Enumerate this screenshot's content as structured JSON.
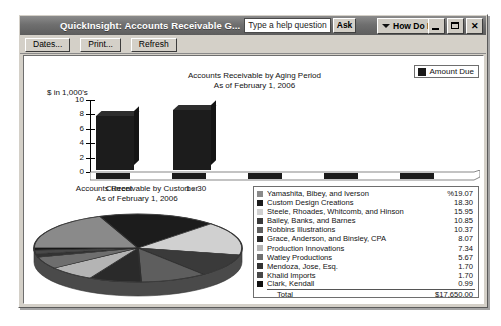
{
  "window": {
    "title": "QuickInsight: Accounts Receivable G...",
    "help_placeholder": "Type a help question",
    "ask_label": "Ask",
    "how_do_i_label": "How Do I?",
    "minimize_label": "Minimize",
    "maximize_label": "Maximize",
    "close_label": "Close"
  },
  "toolbar": {
    "buttons": [
      {
        "label": "Dates..."
      },
      {
        "label": "Print..."
      },
      {
        "label": "Refresh"
      }
    ]
  },
  "bar_chart": {
    "title_line1": "Accounts Receivable by Aging Period",
    "title_line2": "As of February 1, 2006",
    "legend_label": "Amount Due",
    "legend_color": "#1a1a1a",
    "axis_label": "$ in 1,000's"
  },
  "pie_chart": {
    "title_line1": "Accounts Receivable by Customer",
    "title_line2": "As of February 1, 2006"
  },
  "legend": {
    "rows": [
      {
        "name": "Yamashita, Bibey, and Iverson",
        "value": "%19.07",
        "color": "#8a8a8a"
      },
      {
        "name": "Custom Design Creations",
        "value": "18.30",
        "color": "#1c1c1c"
      },
      {
        "name": "Steele, Rhoades, Whitcomb, and Hinson",
        "value": "15.95",
        "color": "#d0d0d0"
      },
      {
        "name": "Bailey, Banks, and Barnes",
        "value": "10.85",
        "color": "#3a3a3a"
      },
      {
        "name": "Robbins Illustrations",
        "value": "10.37",
        "color": "#5e5e5e"
      },
      {
        "name": "Grace, Anderson, and Binsley, CPA",
        "value": "8.07",
        "color": "#2a2a2a"
      },
      {
        "name": "Production Innovations",
        "value": "7.34",
        "color": "#b4b4b4"
      },
      {
        "name": "Watley Productions",
        "value": "5.67",
        "color": "#6e6e6e"
      },
      {
        "name": "Mendoza, Jose, Esq.",
        "value": "1.70",
        "color": "#333333"
      },
      {
        "name": "Khalid Imports",
        "value": "1.70",
        "color": "#484848"
      },
      {
        "name": "Clark, Kendall",
        "value": "0.99",
        "color": "#111111"
      }
    ],
    "total_label": "Total",
    "total_value": "$17,650.00"
  },
  "chart_data": [
    {
      "type": "bar",
      "title": "Accounts Receivable by Aging Period",
      "subtitle": "As of February 1, 2006",
      "categories": [
        "Current",
        "1 - 30",
        "31 - 60",
        "61 - 90",
        "> 90"
      ],
      "series": [
        {
          "name": "Amount Due",
          "values": [
            8.2,
            9.0,
            0.0,
            0.0,
            0.0
          ]
        }
      ],
      "xlabel": "",
      "ylabel": "$ in 1,000's",
      "ylim": [
        0,
        10
      ],
      "yticks": [
        0,
        2,
        4,
        6,
        8,
        10
      ],
      "grid": false,
      "legend_position": "top-right",
      "three_d": true
    },
    {
      "type": "pie",
      "title": "Accounts Receivable by Customer",
      "subtitle": "As of February 1, 2006",
      "unit": "percent",
      "total": "$17,650.00",
      "labels": [
        "Yamashita, Bibey, and Iverson",
        "Custom Design Creations",
        "Steele, Rhoades, Whitcomb, and Hinson",
        "Bailey, Banks, and Barnes",
        "Robbins Illustrations",
        "Grace, Anderson, and Binsley, CPA",
        "Production Innovations",
        "Watley Productions",
        "Mendoza, Jose, Esq.",
        "Khalid Imports",
        "Clark, Kendall"
      ],
      "values": [
        19.07,
        18.3,
        15.95,
        10.85,
        10.37,
        8.07,
        7.34,
        5.67,
        1.7,
        1.7,
        0.99
      ],
      "colors": [
        "#8a8a8a",
        "#1c1c1c",
        "#d0d0d0",
        "#3a3a3a",
        "#5e5e5e",
        "#2a2a2a",
        "#b4b4b4",
        "#6e6e6e",
        "#333333",
        "#484848",
        "#111111"
      ],
      "legend_position": "right",
      "three_d": true
    }
  ]
}
